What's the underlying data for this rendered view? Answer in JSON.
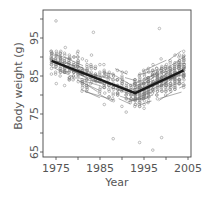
{
  "chart_data": {
    "type": "scatter",
    "title": "",
    "xlabel": "Year",
    "ylabel": "Body weight (g)",
    "xlim": [
      1972,
      2006
    ],
    "ylim": [
      63.5,
      102
    ],
    "x_ticks": [
      1975,
      1980,
      1985,
      1990,
      1995,
      2000,
      2005
    ],
    "x_tick_labels": [
      "1975",
      "1985",
      "1995",
      "2005"
    ],
    "y_ticks": [
      65,
      70,
      75,
      80,
      85,
      90,
      95,
      100
    ],
    "y_tick_labels": [
      "65",
      "75",
      "85",
      "95"
    ],
    "grid": false,
    "legend": null,
    "series": [
      {
        "name": "Population trend (piecewise)",
        "kind": "line",
        "style": "thick",
        "x": [
          1974,
          1993,
          2004
        ],
        "y": [
          89.0,
          80.5,
          86.5
        ]
      },
      {
        "name": "Individual trajectories",
        "kind": "lines",
        "style": "thin",
        "description": "Many short thin line segments for individual birds, declining before ~1993 and rising after"
      },
      {
        "name": "Observations",
        "kind": "scatter",
        "marker": "open-circle",
        "approx_range_by_period": [
          {
            "period": "1974-1982",
            "min": 76,
            "max": 99,
            "center": 88
          },
          {
            "period": "1983-1992",
            "min": 68.5,
            "max": 97,
            "center": 84
          },
          {
            "period": "1993-2004",
            "min": 65.5,
            "max": 97,
            "center": 83
          }
        ],
        "outliers": [
          {
            "x": 1988,
            "y": 68.5
          },
          {
            "x": 1994,
            "y": 67.5
          },
          {
            "x": 1997,
            "y": 65.5
          },
          {
            "x": 1999,
            "y": 68.8
          },
          {
            "x": 1975,
            "y": 99.5
          },
          {
            "x": 1998.5,
            "y": 97.5
          },
          {
            "x": 1983.5,
            "y": 96.5
          }
        ]
      }
    ]
  },
  "axes": {
    "x_title": "Year",
    "y_title": "Body weight (g)",
    "x_labels": [
      "1975",
      "1985",
      "1995",
      "2005"
    ],
    "y_labels": [
      "65",
      "75",
      "85",
      "95"
    ]
  },
  "colors": {
    "axis": "#444444",
    "text": "#555555",
    "points": "#8a8a8a",
    "thin_lines": "#6a6a6a",
    "trend": "#1a1a1a"
  }
}
